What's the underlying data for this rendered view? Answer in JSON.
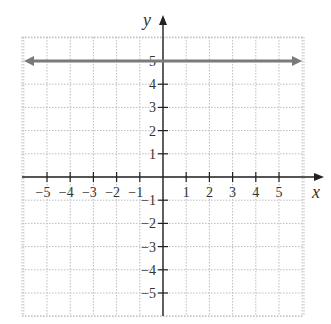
{
  "chart_data": {
    "type": "line",
    "title": "",
    "xlabel": "x",
    "ylabel": "y",
    "xlim": [
      -6,
      6
    ],
    "ylim": [
      -6,
      6
    ],
    "grid": true,
    "grid_style": "dotted",
    "x_ticks": [
      -5,
      -4,
      -3,
      -2,
      -1,
      1,
      2,
      3,
      4,
      5
    ],
    "y_ticks": [
      -5,
      -4,
      -3,
      -2,
      -1,
      1,
      2,
      3,
      4,
      5
    ],
    "x_tick_labels": [
      "−5",
      "−4",
      "−3",
      "−2",
      "−1",
      "1",
      "2",
      "3",
      "4",
      "5"
    ],
    "y_tick_labels": [
      "−5",
      "−4",
      "−3",
      "−2",
      "−1",
      "1",
      "2",
      "3",
      "4",
      "5"
    ],
    "series": [
      {
        "name": "y = 5",
        "equation": "y = 5",
        "x": [
          -6,
          6
        ],
        "y": [
          5,
          5
        ],
        "color": "#7a7a7a",
        "arrows_both_ends": true
      }
    ],
    "legend": null
  },
  "colors": {
    "axis": "#222222",
    "grid": "#bdbdbd",
    "line": "#7a7a7a"
  }
}
